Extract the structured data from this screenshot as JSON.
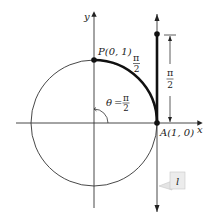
{
  "diagram": {
    "axes": {
      "x_label": "x",
      "y_label": "y"
    },
    "points": {
      "P": {
        "name": "P",
        "coords": "(0, 1)",
        "label": "P(0, 1)"
      },
      "A": {
        "name": "A",
        "coords": "(1, 0)",
        "label": "A(1, 0)"
      }
    },
    "angle": {
      "symbol": "θ",
      "equals": "=",
      "numerator": "π",
      "denominator": "2",
      "text": "θ = π/2"
    },
    "arc_length": {
      "numerator": "π",
      "denominator": "2"
    },
    "tangent_length": {
      "numerator": "π",
      "denominator": "2"
    },
    "tangent_line_label": "l",
    "colors": {
      "stroke": "#222222",
      "callout_bg": "#ececec",
      "callout_border": "#c8c8c8"
    }
  }
}
